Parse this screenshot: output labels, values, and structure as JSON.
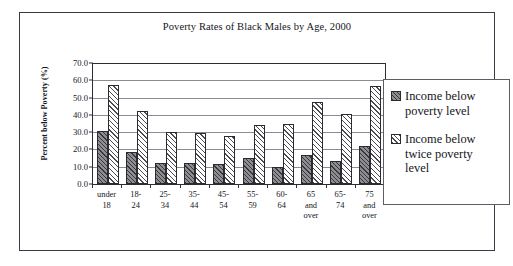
{
  "figure": {
    "title": "Poverty Rates of Black Males by Age, 2000"
  },
  "chart_data": {
    "type": "bar",
    "title": "Poverty Rates of Black Males by Age, 2000",
    "xlabel": "",
    "ylabel": "Percent below Poverty (%)",
    "ylim": [
      0.0,
      70.0
    ],
    "ytick_step": 10.0,
    "ytick_labels": [
      "70.0",
      "60.0",
      "50.0",
      "40.0",
      "30.0",
      "20.0",
      "10.0",
      "0.0"
    ],
    "ytick_values": [
      70.0,
      60.0,
      50.0,
      40.0,
      30.0,
      20.0,
      10.0,
      0.0
    ],
    "grid": true,
    "legend_position": "right",
    "categories": [
      "under 18",
      "18-24",
      "25-34",
      "35-44",
      "45-54",
      "55-59",
      "60-64",
      "65 and over",
      "65-74",
      "75 and over"
    ],
    "category_lines": [
      [
        "under",
        "18"
      ],
      [
        "18-",
        "24"
      ],
      [
        "25-",
        "34"
      ],
      [
        "35-",
        "44"
      ],
      [
        "45-",
        "54"
      ],
      [
        "55-",
        "59"
      ],
      [
        "60-",
        "64"
      ],
      [
        "65",
        "and",
        "over"
      ],
      [
        "65-",
        "74"
      ],
      [
        "75",
        "and",
        "over"
      ]
    ],
    "series": [
      {
        "name": "Income below poverty level",
        "name_lines": [
          "Income below",
          "poverty level"
        ],
        "color": "#8d8d92",
        "values": [
          30.5,
          18.7,
          12.0,
          12.2,
          11.7,
          15.2,
          9.8,
          16.8,
          13.2,
          22.2
        ]
      },
      {
        "name": "Income below twice poverty level",
        "name_lines": [
          "Income below",
          "twice poverty",
          "level"
        ],
        "color": "#ffffff",
        "values": [
          57.5,
          42.2,
          30.3,
          29.6,
          27.6,
          34.0,
          34.6,
          47.2,
          40.5,
          56.7
        ]
      }
    ]
  }
}
